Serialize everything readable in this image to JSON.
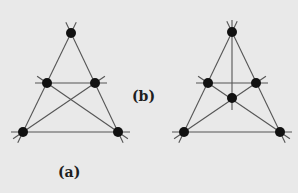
{
  "colors": {
    "background": "#e9e9e9",
    "line": "#555555",
    "dot": "#111111"
  },
  "diagrams": [
    {
      "label": "(a)",
      "points": [
        [
          71,
          33
        ],
        [
          47,
          83
        ],
        [
          95,
          83
        ],
        [
          23,
          132
        ],
        [
          118,
          132
        ]
      ],
      "lines": [
        [
          71,
          33,
          23,
          132
        ],
        [
          71,
          33,
          118,
          132
        ],
        [
          47,
          83,
          95,
          83
        ],
        [
          23,
          132,
          118,
          132
        ],
        [
          47,
          83,
          118,
          132
        ],
        [
          95,
          83,
          23,
          132
        ]
      ]
    },
    {
      "label": "(b)",
      "points": [
        [
          232,
          32
        ],
        [
          208,
          83
        ],
        [
          256,
          83
        ],
        [
          232,
          98
        ],
        [
          184,
          132
        ],
        [
          280,
          132
        ]
      ],
      "lines": [
        [
          232,
          32,
          184,
          132
        ],
        [
          232,
          32,
          280,
          132
        ],
        [
          208,
          83,
          256,
          83
        ],
        [
          184,
          132,
          280,
          132
        ],
        [
          208,
          83,
          280,
          132
        ],
        [
          256,
          83,
          184,
          132
        ],
        [
          232,
          32,
          232,
          98
        ]
      ]
    }
  ]
}
